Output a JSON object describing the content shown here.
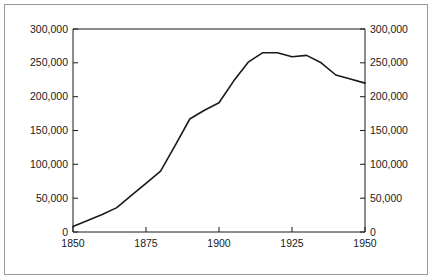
{
  "chart_data": {
    "type": "line",
    "title": "",
    "subtitle": "",
    "xlabel": "",
    "ylabel": "",
    "xlim": [
      1850,
      1950
    ],
    "ylim": [
      0,
      300000
    ],
    "grid": false,
    "legend": null,
    "dual_y_axis": true,
    "x_ticks": [
      1850,
      1875,
      1900,
      1925,
      1950
    ],
    "x_tick_labels": [
      "1850",
      "1875",
      "1900",
      "1925",
      "1950"
    ],
    "y_ticks": [
      0,
      50000,
      100000,
      150000,
      200000,
      250000,
      300000
    ],
    "y_tick_labels": [
      "0",
      "50,000",
      "100,000",
      "150,000",
      "200,000",
      "250,000",
      "300,000"
    ],
    "y_tick_labels_right": [
      "0",
      "50,000",
      "100,000",
      "150,000",
      "200,000",
      "250,000",
      "300,000"
    ],
    "line_color": "#1a1a1a",
    "line_width": 1.6,
    "series": [
      {
        "name": "",
        "x": [
          1850,
          1855,
          1860,
          1865,
          1870,
          1875,
          1880,
          1885,
          1890,
          1895,
          1900,
          1905,
          1910,
          1915,
          1920,
          1925,
          1930,
          1935,
          1940,
          1945,
          1950
        ],
        "values": [
          8000,
          17000,
          26000,
          36000,
          54000,
          72000,
          90000,
          128000,
          167000,
          180000,
          191000,
          223000,
          251000,
          265000,
          265000,
          259000,
          261000,
          250000,
          232000,
          226000,
          220000
        ]
      }
    ]
  },
  "axes": {
    "left_axis_name": "left-value-axis",
    "right_axis_name": "right-value-axis",
    "bottom_axis_name": "year-axis"
  }
}
